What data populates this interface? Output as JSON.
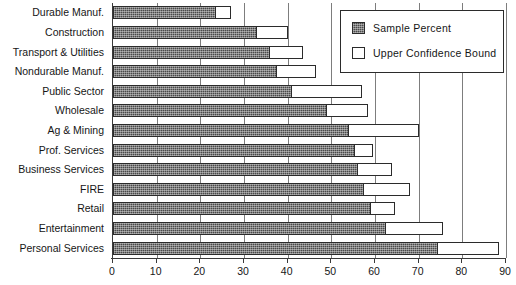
{
  "chart_data": {
    "type": "bar",
    "orientation": "horizontal",
    "title": "",
    "xlabel": "",
    "ylabel": "",
    "xlim": [
      0,
      90
    ],
    "xticks": [
      0,
      10,
      20,
      30,
      40,
      50,
      60,
      70,
      80,
      90
    ],
    "xtick_labels": [
      "0",
      "10",
      "20",
      "30",
      "40",
      "50",
      "60",
      "70",
      "80",
      "90"
    ],
    "grid": true,
    "grid_axis": "x",
    "legend_position": "top-right",
    "categories": [
      "Durable Manuf.",
      "Construction",
      "Transport & Utilities",
      "Nondurable Manuf.",
      "Public Sector",
      "Wholesale",
      "Ag & Mining",
      "Prof. Services",
      "Business Services",
      "FIRE",
      "Retail",
      "Entertainment",
      "Personal Services"
    ],
    "series": [
      {
        "name": "Sample Percent",
        "style": "hatched-dark",
        "color": "#4a4a4a",
        "values": [
          23.5,
          33.0,
          36.0,
          37.5,
          41.0,
          49.0,
          54.0,
          55.5,
          56.0,
          57.5,
          59.0,
          62.5,
          74.5
        ]
      },
      {
        "name": "Upper Confidence Bound",
        "style": "hollow-outline",
        "color": "#ffffff",
        "values": [
          27.0,
          40.0,
          43.5,
          46.5,
          57.0,
          58.5,
          70.0,
          59.5,
          64.0,
          68.0,
          64.5,
          75.5,
          88.5
        ]
      }
    ]
  },
  "legend": {
    "entries": [
      {
        "label": "Sample Percent",
        "swatch": "filled-dark-hatch"
      },
      {
        "label": "Upper Confidence Bound",
        "swatch": "hollow-white"
      }
    ]
  },
  "colors": {
    "sample_fill": "#4a4a4a",
    "bound_fill": "#ffffff",
    "outline": "#2b2b2b",
    "axis": "#3a3a3a",
    "gridline": "#7d7d7d",
    "text": "#161616",
    "background": "#ffffff"
  }
}
